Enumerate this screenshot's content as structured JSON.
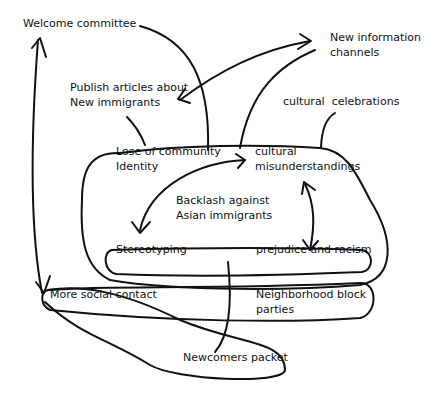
{
  "diagram": {
    "type": "hand-drawn concept map",
    "nodes": [
      {
        "id": "welcome",
        "lines": [
          "Welcome committee"
        ]
      },
      {
        "id": "newinfo",
        "lines": [
          "New information",
          "channels"
        ]
      },
      {
        "id": "publish",
        "lines": [
          "Publish articles about",
          "New immigrants"
        ]
      },
      {
        "id": "celebrations",
        "lines": [
          "cultural  celebrations"
        ]
      },
      {
        "id": "lose",
        "lines": [
          "Lose of community",
          "Identity"
        ]
      },
      {
        "id": "misunder",
        "lines": [
          "cultural",
          "misunderstandings"
        ]
      },
      {
        "id": "backlash",
        "lines": [
          "Backlash against",
          "Asian immigrants"
        ]
      },
      {
        "id": "stereotyping",
        "lines": [
          "Stereotyping"
        ]
      },
      {
        "id": "prejudice",
        "lines": [
          "prejudice and racism"
        ]
      },
      {
        "id": "social",
        "lines": [
          "More social contact"
        ]
      },
      {
        "id": "block",
        "lines": [
          "Neighborhood block",
          "parties"
        ]
      },
      {
        "id": "packet",
        "lines": [
          "Newcomers packet"
        ]
      }
    ],
    "edges": [
      {
        "from": "social",
        "to": "welcome",
        "type": "arrow"
      },
      {
        "from": "welcome",
        "to": "problem-cluster",
        "type": "line"
      },
      {
        "from": "publish",
        "to": "newinfo",
        "type": "double-arrow"
      },
      {
        "from": "newinfo",
        "to": "problem-cluster",
        "type": "line"
      },
      {
        "from": "celebrations",
        "to": "problem-cluster",
        "type": "line"
      },
      {
        "from": "publish",
        "to": "problem-cluster",
        "type": "line"
      },
      {
        "from": "stereotyping",
        "to": "misunder",
        "type": "double-arrow"
      },
      {
        "from": "misunder",
        "to": "prejudice",
        "type": "double-arrow"
      },
      {
        "from": "problem-cluster",
        "to": "packet",
        "type": "line"
      },
      {
        "from": "problem-cluster",
        "to": "social",
        "type": "arrow"
      }
    ]
  }
}
